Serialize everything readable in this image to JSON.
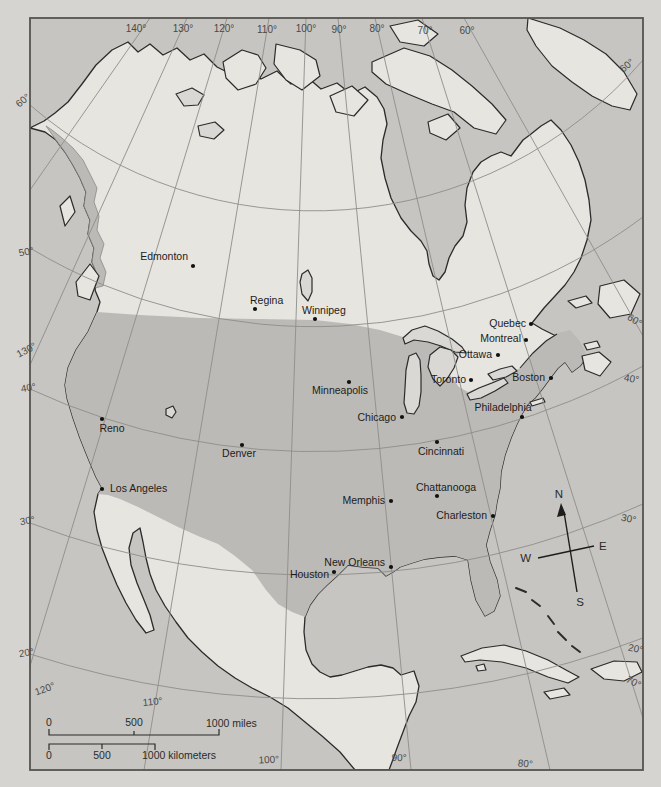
{
  "map": {
    "region": "North America",
    "colors": {
      "page_background": "#d5d4d1",
      "ocean": "#c6c5c2",
      "land": "#e7e5e0",
      "usa_land": "#bcbab7",
      "lakes": "#d9d8d4",
      "coast_outline": "#2b2b2b",
      "graticule": "#8e8d8a",
      "frame": "#55544f"
    },
    "cities": [
      {
        "name": "Edmonton"
      },
      {
        "name": "Regina"
      },
      {
        "name": "Winnipeg"
      },
      {
        "name": "Quebec"
      },
      {
        "name": "Montreal"
      },
      {
        "name": "Ottawa"
      },
      {
        "name": "Toronto"
      },
      {
        "name": "Boston"
      },
      {
        "name": "Philadelphia"
      },
      {
        "name": "Minneapolis"
      },
      {
        "name": "Chicago"
      },
      {
        "name": "Cincinnati"
      },
      {
        "name": "Denver"
      },
      {
        "name": "Reno"
      },
      {
        "name": "Los Angeles"
      },
      {
        "name": "Memphis"
      },
      {
        "name": "Chattanooga"
      },
      {
        "name": "Charleston"
      },
      {
        "name": "New Orleans"
      },
      {
        "name": "Houston"
      }
    ],
    "graticule_labels": {
      "top": [
        "140°",
        "130°",
        "120°",
        "110°",
        "100°",
        "90°",
        "80°",
        "70°",
        "60°"
      ],
      "left": [
        "60°",
        "50°",
        "130°",
        "40°",
        "30°",
        "20°",
        "120°"
      ],
      "right": [
        "60°",
        "60°",
        "40°",
        "30°",
        "20°",
        "70°"
      ],
      "bottom": [
        "110°",
        "100°",
        "90°",
        "80°"
      ]
    },
    "compass": {
      "north": "N",
      "south": "S",
      "east": "E",
      "west": "W"
    },
    "scale_bar": {
      "miles": [
        "0",
        "500",
        "1000 miles"
      ],
      "kilometers": [
        "0",
        "500",
        "1000 kilometers"
      ]
    }
  }
}
